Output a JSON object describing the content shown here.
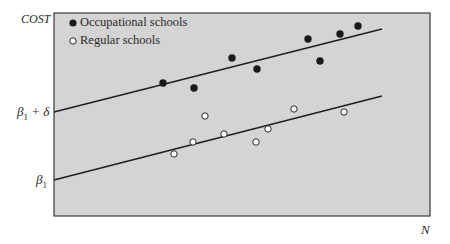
{
  "chart_data": {
    "type": "scatter",
    "title": "",
    "xlabel": "N",
    "ylabel": "COST",
    "y_tick_labels": [
      "β1 + δ",
      "β1"
    ],
    "grid": false,
    "legend_position": "top-left inside",
    "series": [
      {
        "name": "Occupational schools",
        "marker": "filled-circle",
        "color": "#1a1a1a",
        "points": [
          [
            163,
            83
          ],
          [
            194,
            88
          ],
          [
            232,
            58
          ],
          [
            257,
            69
          ],
          [
            308,
            39
          ],
          [
            320,
            61
          ],
          [
            340,
            34
          ],
          [
            358,
            26
          ]
        ],
        "fit_line": {
          "intercept_label": "β1 + δ",
          "from": [
            54,
            112
          ],
          "to": [
            382,
            29
          ]
        }
      },
      {
        "name": "Regular schools",
        "marker": "open-circle",
        "color": "#ffffff",
        "points": [
          [
            174,
            154
          ],
          [
            193,
            142
          ],
          [
            205,
            116
          ],
          [
            224,
            134
          ],
          [
            256,
            142
          ],
          [
            268,
            129
          ],
          [
            294,
            109
          ],
          [
            344,
            112
          ]
        ],
        "fit_line": {
          "intercept_label": "β1",
          "from": [
            54,
            180
          ],
          "to": [
            382,
            96
          ]
        }
      }
    ],
    "note": "Point coordinates are pixel positions in a 450x244 frame; axes carry no numeric scale."
  },
  "labels": {
    "y_axis": "COST",
    "x_axis": "N",
    "upper_intercept_beta": "β",
    "upper_intercept_sub": "1",
    "upper_intercept_rest": " + δ",
    "lower_intercept_beta": "β",
    "lower_intercept_sub": "1"
  },
  "legend": {
    "items": [
      {
        "label": "Occupational schools"
      },
      {
        "label": "Regular schools"
      }
    ]
  },
  "colors": {
    "plot_background": "#d4d4d4",
    "frame": "#3a3a3a",
    "line": "#1e1e1e",
    "filled_marker": "#1a1a1a",
    "open_marker_fill": "#ffffff"
  }
}
